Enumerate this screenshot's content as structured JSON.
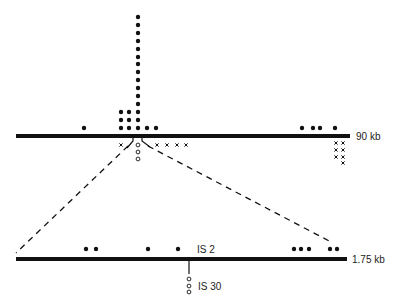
{
  "colors": {
    "ink": "#111111",
    "label": "#222222",
    "background": "#ffffff"
  },
  "top_map": {
    "label": "90 kb",
    "line": {
      "x1": 16,
      "x2": 350,
      "y": 136,
      "thickness": 4
    },
    "filled_dots_above": [
      {
        "x": 84,
        "y": 128
      },
      {
        "x": 121,
        "y": 112
      },
      {
        "x": 121,
        "y": 120
      },
      {
        "x": 121,
        "y": 128
      },
      {
        "x": 129,
        "y": 112
      },
      {
        "x": 129,
        "y": 120
      },
      {
        "x": 129,
        "y": 128
      },
      {
        "x": 138,
        "y": 17
      },
      {
        "x": 138,
        "y": 25
      },
      {
        "x": 138,
        "y": 33
      },
      {
        "x": 138,
        "y": 41
      },
      {
        "x": 138,
        "y": 49
      },
      {
        "x": 138,
        "y": 57
      },
      {
        "x": 138,
        "y": 64
      },
      {
        "x": 138,
        "y": 72
      },
      {
        "x": 138,
        "y": 80
      },
      {
        "x": 138,
        "y": 88
      },
      {
        "x": 138,
        "y": 96
      },
      {
        "x": 138,
        "y": 104
      },
      {
        "x": 138,
        "y": 112
      },
      {
        "x": 138,
        "y": 120
      },
      {
        "x": 138,
        "y": 128
      },
      {
        "x": 147,
        "y": 128
      },
      {
        "x": 156,
        "y": 128
      },
      {
        "x": 302,
        "y": 128
      },
      {
        "x": 313,
        "y": 128
      },
      {
        "x": 320,
        "y": 128
      },
      {
        "x": 335,
        "y": 128
      }
    ],
    "open_circles_below": [
      {
        "x": 138,
        "y": 145
      },
      {
        "x": 138,
        "y": 152
      },
      {
        "x": 138,
        "y": 159
      }
    ],
    "x_marks_below": [
      {
        "x": 121,
        "y": 145
      },
      {
        "x": 157,
        "y": 145
      },
      {
        "x": 167,
        "y": 145
      },
      {
        "x": 177,
        "y": 145
      },
      {
        "x": 186,
        "y": 145
      },
      {
        "x": 336,
        "y": 143
      },
      {
        "x": 343,
        "y": 143
      },
      {
        "x": 336,
        "y": 150
      },
      {
        "x": 343,
        "y": 150
      },
      {
        "x": 336,
        "y": 157
      },
      {
        "x": 343,
        "y": 157
      },
      {
        "x": 343,
        "y": 163
      }
    ]
  },
  "zoom_lines": {
    "left": {
      "x1": 129,
      "y1": 145,
      "x2": 16,
      "y2": 253
    },
    "right": {
      "x1": 147,
      "y1": 145,
      "x2": 333,
      "y2": 243
    }
  },
  "bottom_map": {
    "label": "1.75 kb",
    "line": {
      "x1": 16,
      "x2": 347,
      "y": 259,
      "thickness": 4
    },
    "filled_dots_above": [
      {
        "x": 86,
        "y": 249
      },
      {
        "x": 96,
        "y": 249
      },
      {
        "x": 148,
        "y": 249
      },
      {
        "x": 178,
        "y": 249
      },
      {
        "x": 294,
        "y": 249
      },
      {
        "x": 301,
        "y": 249
      },
      {
        "x": 309,
        "y": 249
      },
      {
        "x": 330,
        "y": 249
      },
      {
        "x": 337,
        "y": 249
      }
    ],
    "is2_label": "IS 2",
    "is30_label": "IS 30",
    "is30_tick": {
      "x": 189,
      "y1": 261,
      "y2": 274
    },
    "open_circles_below": [
      {
        "x": 189,
        "y": 279
      },
      {
        "x": 189,
        "y": 286
      },
      {
        "x": 189,
        "y": 292
      }
    ]
  }
}
